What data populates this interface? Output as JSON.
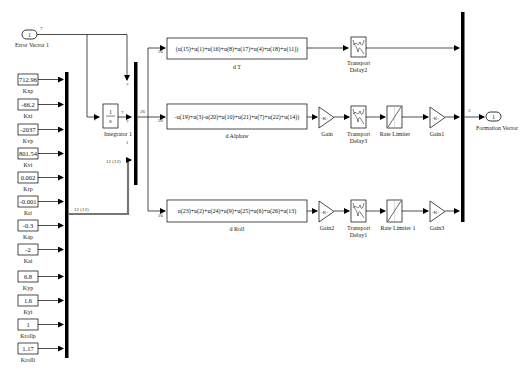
{
  "inport": {
    "number": "1",
    "label": "Error Vector 1",
    "width_label": "7"
  },
  "constants": [
    {
      "value": "712.96",
      "label": "Kxp"
    },
    {
      "value": "-66.2",
      "label": "Kxi"
    },
    {
      "value": "-2037",
      "label": "Kvp"
    },
    {
      "value": "801.54",
      "label": "Kvi"
    },
    {
      "value": "0.002",
      "label": "Krp"
    },
    {
      "value": "-0.001",
      "label": "Kri"
    },
    {
      "value": "-0.3",
      "label": "Kap"
    },
    {
      "value": "-2",
      "label": "Kai"
    },
    {
      "value": "6.8",
      "label": "Kyp"
    },
    {
      "value": "1.6",
      "label": "Kyi"
    },
    {
      "value": "1",
      "label": "Krollp"
    },
    {
      "value": "1.17",
      "label": "Krolli"
    }
  ],
  "integrator": {
    "num": "1",
    "den": "s",
    "label": "Integrator 1",
    "in_width": "7",
    "out_width": "7"
  },
  "mux_main": {
    "out_width": "26",
    "in1_width": "7",
    "in2_width": "7",
    "in3_width": "12 (12)",
    "label": "1"
  },
  "mux_const": {
    "out_width": "12 (12)"
  },
  "fcn_blocks": [
    {
      "expr": "(u(15)+u(1)+u(16)+u(8)+u(17)+u(4)+u(18)+u(11))",
      "label": "d T",
      "in_width": "26"
    },
    {
      "expr": "-u(19)+u(3)-u(20)+u(10)+u(21)+u(7)+u(22)+u(14))",
      "label": "d Alphaw",
      "in_width": "26"
    },
    {
      "expr": "u(23)+u(2)+u(24)+u(9)+u(25)+u(6)+u(26)+u(13)",
      "label": "d Roll",
      "in_width": "26"
    }
  ],
  "row1": {
    "delay_label1": "Transport",
    "delay_label2": "Delay2"
  },
  "row2": {
    "gain_label": "Gain",
    "gain_value": "-K-",
    "delay_label1": "Transport",
    "delay_label2": "Delay3",
    "limiter_label": "Rate Limiter",
    "gain2_label": "Gain1",
    "gain2_value": "-K-"
  },
  "row3": {
    "gain_label": "Gain2",
    "gain_value": "-K-",
    "delay_label1": "Transport",
    "delay_label2": "Delay1",
    "limiter_label": "Rate Limiter 1",
    "gain2_label": "Gain3",
    "gain2_value": "-K-"
  },
  "outport": {
    "number": "1",
    "label": "Formation Vector",
    "width_label": "3"
  }
}
